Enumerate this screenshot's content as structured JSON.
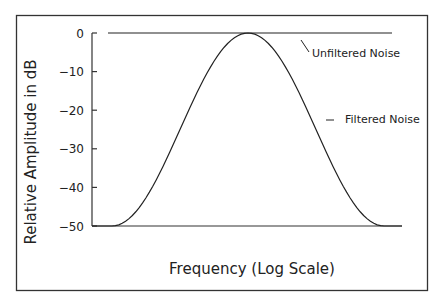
{
  "chart_data": {
    "type": "line",
    "title": "",
    "xlabel": "Frequency (Log Scale)",
    "ylabel": "Relative Amplitude in dB",
    "ylim": [
      -50,
      0
    ],
    "yticks": [
      0,
      -10,
      -20,
      -30,
      -40,
      -50
    ],
    "ytick_labels": [
      "0",
      "−10",
      "−20",
      "−30",
      "−40",
      "−50"
    ],
    "xticks": [],
    "grid": false,
    "x": [
      0.0,
      0.05,
      0.1,
      0.15,
      0.2,
      0.25,
      0.3,
      0.35,
      0.4,
      0.45,
      0.5,
      0.55,
      0.6,
      0.65,
      0.7,
      0.75,
      0.8,
      0.85,
      0.9,
      0.95,
      1.0
    ],
    "series": [
      {
        "name": "Unfiltered Noise",
        "x_range": [
          0,
          1
        ],
        "values": [
          0,
          0,
          0,
          0,
          0,
          0,
          0,
          0,
          0,
          0,
          0,
          0,
          0,
          0,
          0,
          0,
          0,
          0,
          0,
          0,
          0
        ]
      },
      {
        "name": "Filtered Noise",
        "values": [
          -50,
          -50,
          -50,
          -47.6,
          -42.5,
          -35.7,
          -28.0,
          -20.2,
          -13.0,
          -7.1,
          -2.6,
          -0.2,
          -0.2,
          -2.6,
          -7.1,
          -13.0,
          -20.2,
          -28.0,
          -35.7,
          -42.5,
          -50
        ]
      }
    ],
    "annotations": [
      {
        "text": "Unfiltered Noise",
        "points_to": "Unfiltered Noise"
      },
      {
        "text": "Filtered Noise",
        "points_to": "Filtered Noise"
      }
    ],
    "legend_position": "inline-right"
  },
  "labels": {
    "ylabel": "Relative Amplitude in dB",
    "xlabel": "Frequency (Log Scale)",
    "legend_unfiltered": "Unfiltered Noise",
    "legend_filtered": "Filtered Noise",
    "ticks": [
      "0",
      "−10",
      "−20",
      "−30",
      "−40",
      "−50"
    ]
  },
  "colors": {
    "line": "#222222",
    "frame": "#333333",
    "background": "#ffffff"
  }
}
